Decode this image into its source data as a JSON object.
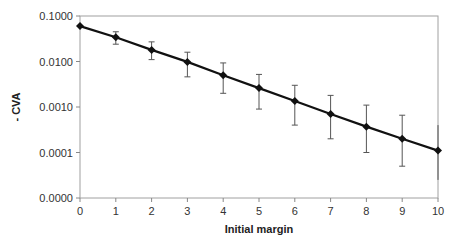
{
  "chart_data": {
    "type": "line",
    "title": "",
    "xlabel": "Initial margin",
    "ylabel": "- CVA",
    "yscale": "log",
    "x": [
      0,
      1,
      2,
      3,
      4,
      5,
      6,
      7,
      8,
      9,
      10
    ],
    "series": [
      {
        "name": "- CVA",
        "values": [
          0.06,
          0.034,
          0.018,
          0.0098,
          0.005,
          0.0026,
          0.00135,
          0.0007,
          0.00037,
          0.0002,
          0.00011
        ],
        "error_upper": [
          0.06,
          0.045,
          0.027,
          0.016,
          0.0093,
          0.0052,
          0.003,
          0.0018,
          0.0011,
          0.00066,
          0.0004
        ],
        "error_lower": [
          0.06,
          0.024,
          0.011,
          0.0046,
          0.002,
          0.0009,
          0.0004,
          0.0002,
          0.0001,
          5e-05,
          2.5e-05
        ]
      }
    ],
    "xticks": [
      "0",
      "1",
      "2",
      "3",
      "4",
      "5",
      "6",
      "7",
      "8",
      "9",
      "10"
    ],
    "yticks": [
      "0.1000",
      "0.0100",
      "0.0010",
      "0.0001",
      "0.0000"
    ],
    "ylim": [
      1e-05,
      0.1
    ],
    "xlim": [
      0,
      10
    ],
    "grid": false,
    "legend": null
  }
}
